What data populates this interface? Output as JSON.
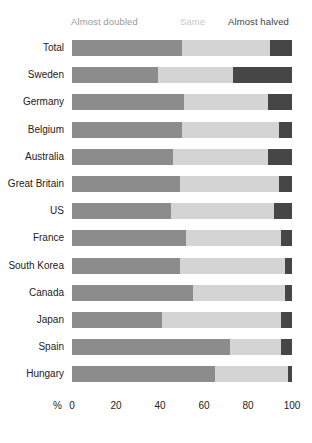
{
  "legend": {
    "doubled": "Almost doubled",
    "same": "Same",
    "halved": "Almost halved"
  },
  "axis": {
    "unit": "%",
    "ticks": [
      "0",
      "20",
      "40",
      "60",
      "80",
      "100"
    ]
  },
  "colors": {
    "doubled": "#8c8c8c",
    "same": "#d4d4d4",
    "halved": "#464646",
    "background": "#ffffff",
    "text": "#222222"
  },
  "chart_data": {
    "type": "bar",
    "orientation": "horizontal",
    "stacked": true,
    "title": "",
    "xlabel": "%",
    "ylabel": "",
    "xlim": [
      0,
      100
    ],
    "xticks": [
      0,
      20,
      40,
      60,
      80,
      100
    ],
    "grid": false,
    "legend_position": "top",
    "categories": [
      "Total",
      "Sweden",
      "Germany",
      "Belgium",
      "Australia",
      "Great Britain",
      "US",
      "France",
      "South Korea",
      "Canada",
      "Japan",
      "Spain",
      "Hungary"
    ],
    "series": [
      {
        "name": "Almost doubled",
        "values": [
          50,
          39,
          51,
          50,
          46,
          49,
          45,
          52,
          49,
          55,
          41,
          72,
          65
        ]
      },
      {
        "name": "Same",
        "values": [
          40,
          34,
          38,
          44,
          43,
          45,
          47,
          43,
          48,
          42,
          54,
          23,
          33
        ]
      },
      {
        "name": "Almost halved",
        "values": [
          10,
          27,
          11,
          6,
          11,
          6,
          8,
          5,
          3,
          3,
          5,
          5,
          2
        ]
      }
    ]
  }
}
